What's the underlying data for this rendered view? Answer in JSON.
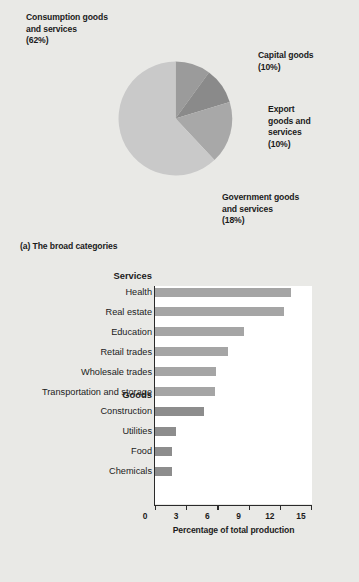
{
  "figure": {
    "panel_a": {
      "caption": "(a) The broad categories",
      "labels": [
        {
          "name": "consumption",
          "line1": "Consumption goods",
          "line2": "and services",
          "line3": "(62%)"
        },
        {
          "name": "capital",
          "line1": "Capital goods",
          "line2": "(10%)",
          "line3": ""
        },
        {
          "name": "export",
          "line1": "Export",
          "line2": "goods and",
          "line3": "services",
          "line4": "(10%)"
        },
        {
          "name": "government",
          "line1": "Government goods",
          "line2": "and services",
          "line3": "(18%)"
        }
      ]
    },
    "panel_b": {
      "caption": "(b) Some of the details"
    }
  },
  "chart_data": [
    {
      "type": "pie",
      "title": "The broad categories",
      "legend_position": "callout-labels",
      "labels": [
        "Capital goods",
        "Export goods and services",
        "Government goods and services",
        "Consumption goods and services"
      ],
      "values": [
        10,
        10,
        18,
        62
      ],
      "value_suffix": "%",
      "colors": [
        "#9b9b9b",
        "#8a8a8a",
        "#a8a8a8",
        "#c9c9c9"
      ],
      "start_angle_deg": 0,
      "direction": "clockwise"
    },
    {
      "type": "bar",
      "orientation": "horizontal",
      "title": "Some of the details",
      "xlabel": "Percentage of total production",
      "ylabel": "",
      "xlim": [
        0,
        15
      ],
      "xticks": [
        0,
        3,
        6,
        9,
        12,
        15
      ],
      "grid": false,
      "groups": [
        {
          "name": "Services",
          "color": "#a5a5a5",
          "categories": [
            "Health",
            "Real estate",
            "Education",
            "Retail trades",
            "Wholesale trades",
            "Transportation and storage"
          ],
          "values": [
            13.1,
            12.4,
            8.6,
            7.0,
            5.9,
            5.8
          ]
        },
        {
          "name": "Goods",
          "color": "#8d8d8d",
          "categories": [
            "Construction",
            "Utilities",
            "Food",
            "Chemicals"
          ],
          "values": [
            4.7,
            2.0,
            1.6,
            1.6
          ]
        }
      ]
    }
  ]
}
